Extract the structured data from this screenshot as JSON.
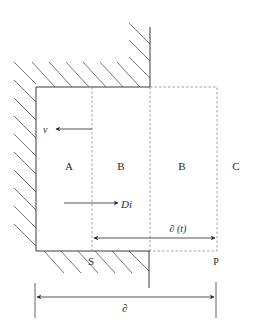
{
  "diagram": {
    "type": "physical-schematic",
    "regions": [
      {
        "id": "A",
        "label": "A"
      },
      {
        "id": "B1",
        "label": "B"
      },
      {
        "id": "B2",
        "label": "B"
      },
      {
        "id": "C",
        "label": "C"
      }
    ],
    "arrows": {
      "velocity": {
        "label": "v",
        "direction": "left"
      },
      "diffusion": {
        "label": "Di",
        "direction": "right"
      },
      "delta_t": {
        "label": "∂ (t)",
        "direction": "both"
      },
      "delta": {
        "label": "∂",
        "direction": "both"
      }
    },
    "points": {
      "s": {
        "label": "S"
      },
      "p": {
        "label": "P"
      }
    },
    "colors": {
      "line": "#3a3a3a",
      "dashed": "#8a8a8a",
      "hatch": "#555555"
    }
  }
}
